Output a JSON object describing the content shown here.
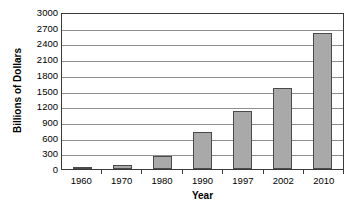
{
  "chart_data": {
    "type": "bar",
    "title": "",
    "xlabel": "Year",
    "ylabel": "Billions of Dollars",
    "categories": [
      "1960",
      "1970",
      "1980",
      "1990",
      "1997",
      "2002",
      "2010"
    ],
    "values": [
      25,
      75,
      240,
      700,
      1100,
      1550,
      2600
    ],
    "ylim": [
      0,
      3000
    ],
    "ytick_labels": [
      "3000",
      "2700",
      "2400",
      "2100",
      "1800",
      "1500",
      "1200",
      "900",
      "600",
      "300",
      "0"
    ],
    "ytick_values": [
      3000,
      2700,
      2400,
      2100,
      1800,
      1500,
      1200,
      900,
      600,
      300,
      0
    ],
    "ytick_step": 300,
    "grid": true,
    "grid_axis": "y",
    "legend": false,
    "legend_position": "none",
    "bar_color": "#a9a9a9",
    "bar_border_color": "#4a4a4a",
    "gridline_color": "#8f8f8f",
    "axis_color": "#3a3a3a",
    "background_color": "#ffffff"
  }
}
